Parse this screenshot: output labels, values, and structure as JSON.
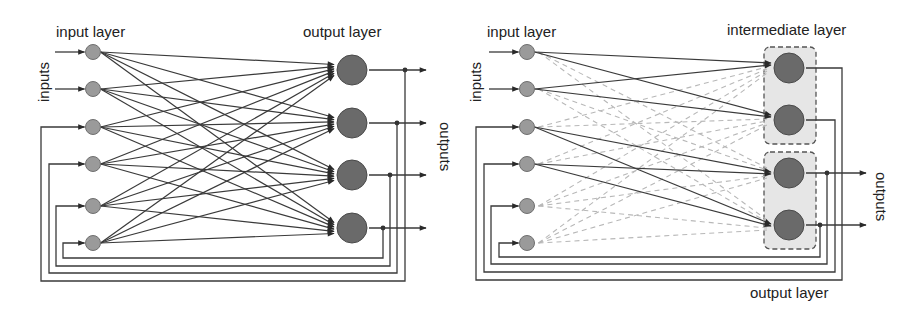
{
  "diagrams": [
    {
      "id": "fully-connected-recurrent-network",
      "labels": {
        "input_layer": "input layer",
        "output_layer": "output layer",
        "inputs": "inputs",
        "outputs": "outputs"
      },
      "input_node_count": 6,
      "external_input_count": 2,
      "output_node_count": 4,
      "connectivity": "full",
      "feedback": "each output neuron feeds back to an input neuron (outputs 1-4 -> inputs 3-6)"
    },
    {
      "id": "partially-connected-network-with-intermediate-layer",
      "labels": {
        "input_layer": "input layer",
        "intermediate_layer": "intermediate layer",
        "output_layer": "output layer",
        "inputs": "inputs",
        "outputs": "outputs"
      },
      "input_node_count": 6,
      "external_input_count": 2,
      "intermediate_node_count": 4,
      "output_group_nodes": [
        3,
        4
      ],
      "active_connections": [
        [
          1,
          1
        ],
        [
          1,
          2
        ],
        [
          2,
          1
        ],
        [
          2,
          2
        ],
        [
          3,
          3
        ],
        [
          3,
          4
        ],
        [
          4,
          3
        ],
        [
          4,
          4
        ]
      ],
      "inactive_connections": "all remaining input-to-intermediate pairs (dashed grey)",
      "feedback": "each intermediate neuron feeds back to an input neuron (nodes 1-4 -> inputs 3-6)"
    }
  ],
  "colors": {
    "edge_active": "#3a3a3a",
    "edge_inactive": "#b8b8b8",
    "input_node": "#9a9a9a",
    "output_node": "#6a6a6a",
    "group_fill": "#e6e6e6"
  }
}
